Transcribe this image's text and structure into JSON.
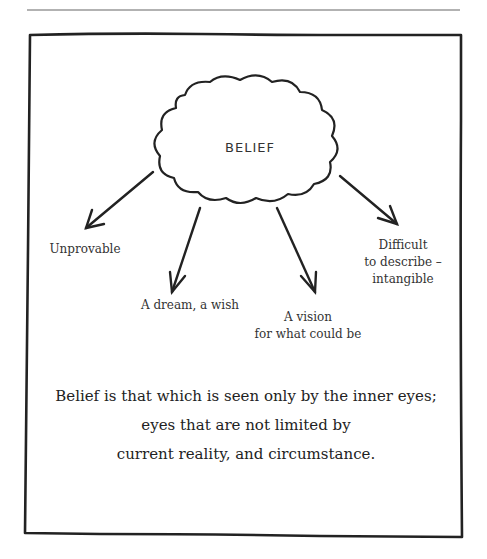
{
  "diagram": {
    "central_concept": "BELIEF",
    "branches": [
      {
        "label_lines": [
          "Unprovable"
        ]
      },
      {
        "label_lines": [
          "A dream, a wish"
        ]
      },
      {
        "label_lines": [
          "A vision",
          "for what could be"
        ]
      },
      {
        "label_lines": [
          "Difficult",
          "to describe –",
          "intangible"
        ]
      }
    ],
    "quote_lines": [
      "Belief is that which is seen only by the inner eyes;",
      "eyes that are not limited by",
      "current reality, and circumstance."
    ]
  },
  "colors": {
    "ink": "#2a2a2a",
    "background": "#ffffff",
    "rule": "#555555"
  }
}
